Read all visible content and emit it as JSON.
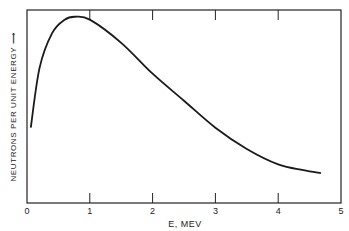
{
  "chart_data": {
    "type": "line",
    "title": "",
    "xlabel": "E, MEV",
    "ylabel": "NEUTRONS PER UNIT ENERGY",
    "ylabel_arrow": "→",
    "xlim": [
      0,
      5
    ],
    "ylim": [
      0,
      100
    ],
    "x_ticks": [
      "0",
      "1",
      "2",
      "3",
      "4",
      "5"
    ],
    "y_ticks": [],
    "grid": false,
    "legend": null,
    "series": [
      {
        "name": "Fission neutron energy spectrum",
        "x": [
          0.06,
          0.2,
          0.4,
          0.6,
          0.76,
          1.0,
          1.5,
          2.0,
          2.5,
          3.0,
          3.5,
          4.0,
          4.4,
          4.68
        ],
        "y": [
          39,
          70,
          88,
          95,
          96.5,
          95,
          83,
          67,
          53,
          39,
          28,
          20,
          17,
          15.5
        ]
      }
    ],
    "color": "#1a1a1a"
  }
}
